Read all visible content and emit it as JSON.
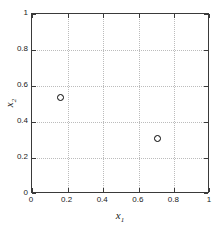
{
  "chart_data": {
    "type": "scatter",
    "title": "",
    "xlabel": "x",
    "xlabel_sub": "1",
    "ylabel": "x",
    "ylabel_sub": "2",
    "xlim": [
      0,
      1
    ],
    "ylim": [
      0,
      1
    ],
    "grid": true,
    "legend": null,
    "marker_style": "open-circle",
    "marker_color": "#000000",
    "xticks": [
      "0",
      "0.2",
      "0.4",
      "0.6",
      "0.8",
      "1"
    ],
    "xtick_values": [
      0,
      0.2,
      0.4,
      0.6,
      0.8,
      1
    ],
    "yticks": [
      "0",
      "0.2",
      "0.4",
      "0.6",
      "0.8",
      "1"
    ],
    "ytick_values": [
      0,
      0.2,
      0.4,
      0.6,
      0.8,
      1
    ],
    "points": [
      {
        "x": 0.16,
        "y": 0.535,
        "label": "point-1"
      },
      {
        "x": 0.705,
        "y": 0.31,
        "label": "point-2"
      }
    ],
    "axis_color": "#3a3a3a",
    "grid_color": "#bcbcbc",
    "background": "#ffffff"
  }
}
